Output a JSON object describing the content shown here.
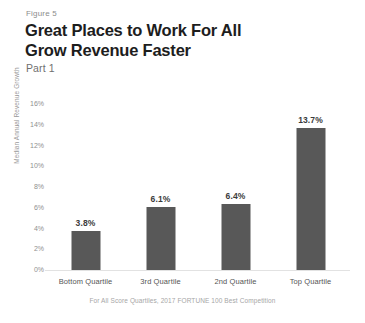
{
  "figure": {
    "label": "Figure 5",
    "title_line1": "Great Places to Work For All",
    "title_line2": "Grow Revenue Faster",
    "subtitle": "Part 1"
  },
  "chart_data": {
    "type": "bar",
    "title": "Great Places to Work For All Grow Revenue Faster",
    "subtitle": "Part 1",
    "categories": [
      "Bottom Quartile",
      "3rd Quartile",
      "2nd Quartile",
      "Top Quartile"
    ],
    "values": [
      3.8,
      6.1,
      6.4,
      13.7
    ],
    "value_labels": [
      "3.8%",
      "6.1%",
      "6.4%",
      "13.7%"
    ],
    "xlabel": "",
    "ylabel": "Median Annual Revenue Growth",
    "ylim": [
      0,
      16
    ],
    "ytick_values": [
      16,
      14,
      12,
      10,
      8,
      6,
      4,
      2,
      0
    ],
    "ytick_labels": [
      "16%",
      "14%",
      "12%",
      "10%",
      "8%",
      "6%",
      "4%",
      "2%",
      "0%"
    ],
    "grid": false,
    "legend": null,
    "annotation": "For All Score Quartiles, 2017 FORTUNE 100 Best Competition",
    "bar_color": "#585858",
    "background_color": "#ffffff"
  }
}
